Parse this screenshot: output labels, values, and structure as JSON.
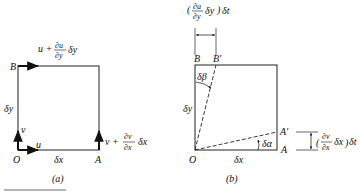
{
  "panel_a": {
    "caption": "(a)",
    "points": {
      "O": "O",
      "A": "A",
      "B": "B"
    },
    "dims": {
      "dx": "δx",
      "dy": "δy"
    },
    "velocities": {
      "u": "u",
      "v": "v",
      "top_u_prefix": "u +",
      "top_num": "∂u",
      "top_den": "∂y",
      "top_suffix": "δy",
      "right_v_prefix": "v +",
      "right_num": "∂v",
      "right_den": "∂x",
      "right_suffix": "δx"
    }
  },
  "panel_b": {
    "caption": "(b)",
    "points": {
      "O": "O",
      "A": "A",
      "A_prime": "A'",
      "B": "B",
      "B_prime": "B'"
    },
    "dims": {
      "dx": "δx",
      "dy": "δy"
    },
    "angles": {
      "alpha": "δα",
      "beta": "δβ"
    },
    "top_disp": {
      "num": "∂u",
      "den": "∂y",
      "mid": "δy",
      "dt": "δt"
    },
    "right_disp": {
      "num": "∂v",
      "den": "∂x",
      "mid": "δx",
      "dt": "δt"
    }
  }
}
